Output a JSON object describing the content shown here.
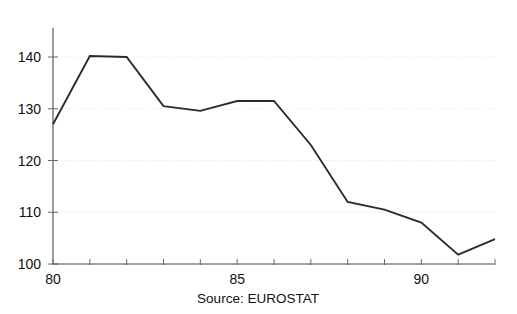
{
  "chart_data": {
    "type": "line",
    "title": "",
    "subtitle": "",
    "xlabel": "",
    "ylabel": "",
    "source_note": "Source: EUROSTAT",
    "x": [
      80,
      81,
      82,
      83,
      84,
      85,
      86,
      87,
      88,
      89,
      90,
      91,
      92
    ],
    "series": [
      {
        "name": "index",
        "values": [
          127.0,
          140.2,
          140.0,
          130.5,
          129.6,
          131.5,
          131.5,
          123.0,
          112.0,
          110.5,
          108.0,
          101.8,
          104.8
        ]
      }
    ],
    "xlim": [
      80,
      92
    ],
    "ylim": [
      100,
      145
    ],
    "y_ticks": [
      100,
      110,
      120,
      130,
      140
    ],
    "y_tick_labels": [
      "100",
      "110",
      "120",
      "130",
      "140"
    ],
    "x_ticks": [
      80,
      81,
      82,
      83,
      84,
      85,
      86,
      87,
      88,
      89,
      90,
      91,
      92
    ],
    "x_tick_labels_shown": [
      {
        "value": 80,
        "label": "80"
      },
      {
        "value": 85,
        "label": "85"
      },
      {
        "value": 90,
        "label": "90"
      }
    ],
    "grid": true,
    "grid_axis": "y",
    "grid_style": "dotted",
    "legend": false,
    "legend_position": "none",
    "line_color": "#2b2b2b",
    "grid_color": "#dddddd",
    "axis_color": "#4a4a4a",
    "background_color": "#ffffff"
  }
}
